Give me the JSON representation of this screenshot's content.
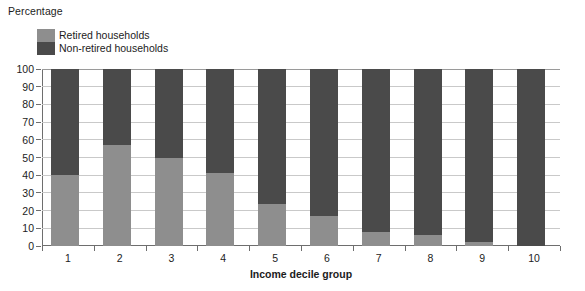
{
  "chart_data": {
    "type": "bar",
    "subtype": "stacked-100-percent",
    "title": "",
    "ylabel": "Percentage",
    "xlabel": "Income decile group",
    "categories": [
      "1",
      "2",
      "3",
      "4",
      "5",
      "6",
      "7",
      "8",
      "9",
      "10"
    ],
    "ylim": [
      0,
      100
    ],
    "yticks": [
      0,
      10,
      20,
      30,
      40,
      50,
      60,
      70,
      80,
      90,
      100
    ],
    "ytick_labels": [
      "0",
      "10",
      "20",
      "30",
      "40",
      "50",
      "60",
      "70",
      "80",
      "90",
      "100"
    ],
    "grid": true,
    "legend_position": "top-left",
    "series": [
      {
        "name": "Retired households",
        "color": "#8e8e8e",
        "values": [
          40,
          57,
          50,
          41,
          24,
          17,
          8,
          6,
          2,
          0
        ]
      },
      {
        "name": "Non-retired households",
        "color": "#4a4a4a",
        "values": [
          60,
          43,
          50,
          59,
          76,
          83,
          92,
          94,
          98,
          100
        ]
      }
    ]
  },
  "legend": {
    "items": [
      {
        "label": "Retired households",
        "swatch": "retired-swatch"
      },
      {
        "label": "Non-retired households",
        "swatch": "non-retired-swatch"
      }
    ]
  },
  "axes": {
    "y_title": "Percentage",
    "x_title": "Income decile group"
  },
  "colors": {
    "retired": "#8e8e8e",
    "non_retired": "#4a4a4a",
    "gridline": "#c9c9c9",
    "axis": "#6e6e6e",
    "background": "#ffffff",
    "text": "#1c1c1c"
  }
}
